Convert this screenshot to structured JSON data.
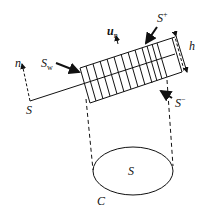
{
  "diagram": {
    "labels": {
      "n": "n",
      "S_left": "S",
      "S_w": "S",
      "S_w_sub": "w",
      "u_n": "u",
      "u_n_sub": "n",
      "S_plus": "S",
      "S_plus_sup": "+",
      "h": "h",
      "S_minus": "S",
      "S_minus_sup": "−",
      "S_center": "S",
      "C": "C"
    },
    "colors": {
      "stroke": "#111111",
      "background": "#ffffff"
    }
  }
}
